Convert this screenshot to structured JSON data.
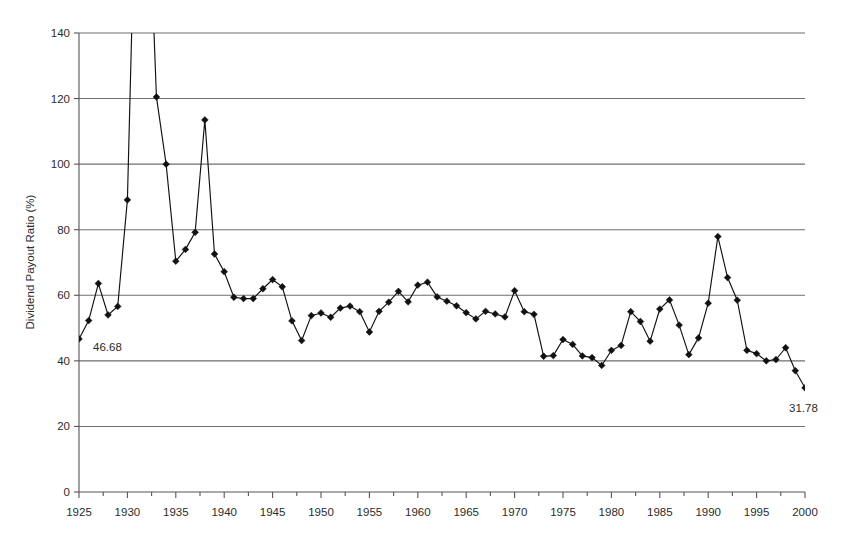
{
  "chart_data": {
    "type": "line",
    "title": "",
    "xlabel": "",
    "ylabel": "Dividend Payout Ratio (%)",
    "xlim": [
      1925,
      2000
    ],
    "ylim": [
      0,
      140
    ],
    "ytick_step": 20,
    "xtick_step": 5,
    "minor_xtick_step": 2.5,
    "grid": "horizontal",
    "legend": "none",
    "marker": "diamond",
    "line_color": "#111111",
    "grid_color": "#6e6e6e",
    "xticks": [
      1925,
      1930,
      1935,
      1940,
      1945,
      1950,
      1955,
      1960,
      1965,
      1970,
      1975,
      1980,
      1985,
      1990,
      1995,
      2000
    ],
    "yticks": [
      0,
      20,
      40,
      60,
      80,
      100,
      120,
      140
    ],
    "x": [
      1925,
      1926,
      1927,
      1928,
      1929,
      1930,
      1931,
      1932,
      1933,
      1934,
      1935,
      1936,
      1937,
      1938,
      1939,
      1940,
      1941,
      1942,
      1943,
      1944,
      1945,
      1946,
      1947,
      1948,
      1949,
      1950,
      1951,
      1952,
      1953,
      1954,
      1955,
      1956,
      1957,
      1958,
      1959,
      1960,
      1961,
      1962,
      1963,
      1964,
      1965,
      1966,
      1967,
      1968,
      1969,
      1970,
      1971,
      1972,
      1973,
      1974,
      1975,
      1976,
      1977,
      1978,
      1979,
      1980,
      1981,
      1982,
      1983,
      1984,
      1985,
      1986,
      1987,
      1988,
      1989,
      1990,
      1991,
      1992,
      1993,
      1994,
      1995,
      1996,
      1997,
      1998,
      1999,
      2000
    ],
    "values": [
      46.68,
      52.3,
      63.6,
      54.0,
      56.6,
      89.1,
      205.0,
      198.0,
      120.5,
      100.0,
      70.4,
      74.0,
      79.2,
      113.5,
      72.6,
      67.2,
      59.4,
      59.0,
      59.0,
      62.0,
      64.8,
      62.6,
      52.2,
      46.2,
      53.8,
      54.6,
      53.3,
      56.1,
      56.7,
      55.0,
      48.8,
      55.1,
      57.9,
      61.2,
      58.0,
      63.1,
      64.0,
      59.5,
      58.2,
      56.8,
      54.7,
      52.8,
      55.1,
      54.3,
      53.4,
      61.4,
      55.0,
      54.2,
      41.4,
      41.6,
      46.5,
      45.0,
      41.5,
      41.0,
      38.6,
      43.2,
      44.7,
      55.0,
      52.0,
      46.0,
      55.8,
      58.6,
      50.9,
      41.9,
      47.0,
      57.6,
      77.9,
      65.4,
      58.5,
      43.2,
      42.2,
      40.0,
      40.4,
      44.0,
      37.0,
      31.78
    ],
    "annotations": [
      {
        "label": "46.68",
        "year": 1925,
        "value": 46.68,
        "dx": 14,
        "dy": 12
      },
      {
        "label": "31.78",
        "year": 2000,
        "value": 31.78,
        "dx": -16,
        "dy": 24
      }
    ],
    "clip_note": "Values for 1931 and 1932 exceed the 140 axis maximum; their lines run off the top of the plot."
  }
}
